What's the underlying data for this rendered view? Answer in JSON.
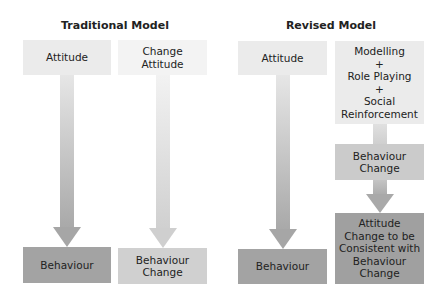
{
  "traditional_model": {
    "title": "Traditional Model",
    "left_column": {
      "top_box": "Attitude",
      "bottom_box": "Behaviour"
    },
    "right_column": {
      "top_box": "Change\nAttitude",
      "bottom_box": "Behaviour\nChange"
    }
  },
  "revised_model": {
    "title": "Revised Model",
    "left_column": {
      "top_box": "Attitude",
      "bottom_box": "Behaviour"
    },
    "right_column": {
      "top_box": "Modelling\n+\nRole Playing\n+\nSocial\nReinforcement",
      "middle_box": "Behaviour\nChange",
      "bottom_box": "Attitude\nChange to be\nConsistent with\nBehaviour\nChange"
    }
  },
  "colors": {
    "light_box": "#ebebeb",
    "lighter_box": "#f3f3f3",
    "dark_box": "#a3a3a3",
    "mid_box": "#cdcdcd",
    "arrow_dark": "#a8a8a8",
    "arrow_light": "#d2d2d2"
  }
}
